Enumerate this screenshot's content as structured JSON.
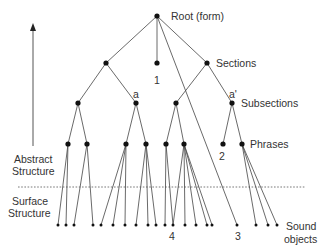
{
  "diagram": {
    "type": "tree",
    "colors": {
      "line": "#444444",
      "node": "#111111",
      "text": "#333333",
      "dotted": "#555555"
    },
    "level_labels": {
      "root": "Root (form)",
      "sections": "Sections",
      "subsections": "Subsections",
      "phrases": "Phrases",
      "sound_objects": [
        "Sound",
        "objects"
      ]
    },
    "side_labels": {
      "abstract": [
        "Abstract",
        "Structure"
      ],
      "surface": [
        "Surface",
        "Structure"
      ]
    },
    "node_labels": {
      "one": "1",
      "two": "2",
      "three": "3",
      "four": "4",
      "a": "a",
      "a_prime": "a'"
    },
    "nodes": {
      "root": [
        157,
        16
      ],
      "sections": [
        [
          106,
          63
        ],
        [
          157,
          63
        ],
        [
          207,
          63
        ]
      ],
      "subsections": [
        [
          78,
          103
        ],
        [
          136,
          103
        ],
        [
          176,
          103
        ],
        [
          232,
          103
        ]
      ],
      "phrases": [
        [
          68,
          144
        ],
        [
          87,
          144
        ],
        [
          126,
          144
        ],
        [
          146,
          144
        ],
        [
          166,
          144
        ],
        [
          184,
          144
        ],
        [
          223,
          144
        ],
        [
          242,
          144
        ]
      ],
      "leaves_y": 225,
      "leaves_x": [
        58,
        66,
        74,
        93,
        101,
        113,
        125,
        136,
        148,
        156,
        165,
        173,
        185,
        196,
        207,
        212,
        237,
        256,
        268,
        277
      ]
    },
    "edges": [
      [
        [
          157,
          16
        ],
        [
          106,
          63
        ]
      ],
      [
        [
          157,
          16
        ],
        [
          157,
          63
        ]
      ],
      [
        [
          157,
          16
        ],
        [
          207,
          63
        ]
      ],
      [
        [
          157,
          16
        ],
        [
          237,
          225
        ]
      ],
      [
        [
          106,
          63
        ],
        [
          78,
          103
        ]
      ],
      [
        [
          106,
          63
        ],
        [
          136,
          103
        ]
      ],
      [
        [
          207,
          63
        ],
        [
          176,
          103
        ]
      ],
      [
        [
          207,
          63
        ],
        [
          232,
          103
        ]
      ],
      [
        [
          78,
          103
        ],
        [
          68,
          144
        ]
      ],
      [
        [
          78,
          103
        ],
        [
          87,
          144
        ]
      ],
      [
        [
          136,
          103
        ],
        [
          126,
          144
        ]
      ],
      [
        [
          136,
          103
        ],
        [
          146,
          144
        ]
      ],
      [
        [
          176,
          103
        ],
        [
          166,
          144
        ]
      ],
      [
        [
          176,
          103
        ],
        [
          184,
          144
        ]
      ],
      [
        [
          232,
          103
        ],
        [
          223,
          144
        ]
      ],
      [
        [
          232,
          103
        ],
        [
          242,
          144
        ]
      ],
      [
        [
          68,
          144
        ],
        [
          58,
          225
        ]
      ],
      [
        [
          68,
          144
        ],
        [
          66,
          225
        ]
      ],
      [
        [
          87,
          144
        ],
        [
          74,
          225
        ]
      ],
      [
        [
          87,
          144
        ],
        [
          93,
          225
        ]
      ],
      [
        [
          126,
          144
        ],
        [
          101,
          225
        ]
      ],
      [
        [
          126,
          144
        ],
        [
          113,
          225
        ]
      ],
      [
        [
          126,
          144
        ],
        [
          125,
          225
        ]
      ],
      [
        [
          146,
          144
        ],
        [
          136,
          225
        ]
      ],
      [
        [
          146,
          144
        ],
        [
          148,
          225
        ]
      ],
      [
        [
          146,
          144
        ],
        [
          156,
          225
        ]
      ],
      [
        [
          166,
          144
        ],
        [
          165,
          225
        ]
      ],
      [
        [
          166,
          144
        ],
        [
          173,
          225
        ]
      ],
      [
        [
          184,
          144
        ],
        [
          173,
          225
        ]
      ],
      [
        [
          184,
          144
        ],
        [
          185,
          225
        ]
      ],
      [
        [
          184,
          144
        ],
        [
          196,
          225
        ]
      ],
      [
        [
          184,
          144
        ],
        [
          207,
          225
        ]
      ],
      [
        [
          184,
          144
        ],
        [
          212,
          225
        ]
      ],
      [
        [
          242,
          144
        ],
        [
          256,
          225
        ]
      ],
      [
        [
          242,
          144
        ],
        [
          268,
          225
        ]
      ],
      [
        [
          242,
          144
        ],
        [
          277,
          225
        ]
      ]
    ]
  }
}
